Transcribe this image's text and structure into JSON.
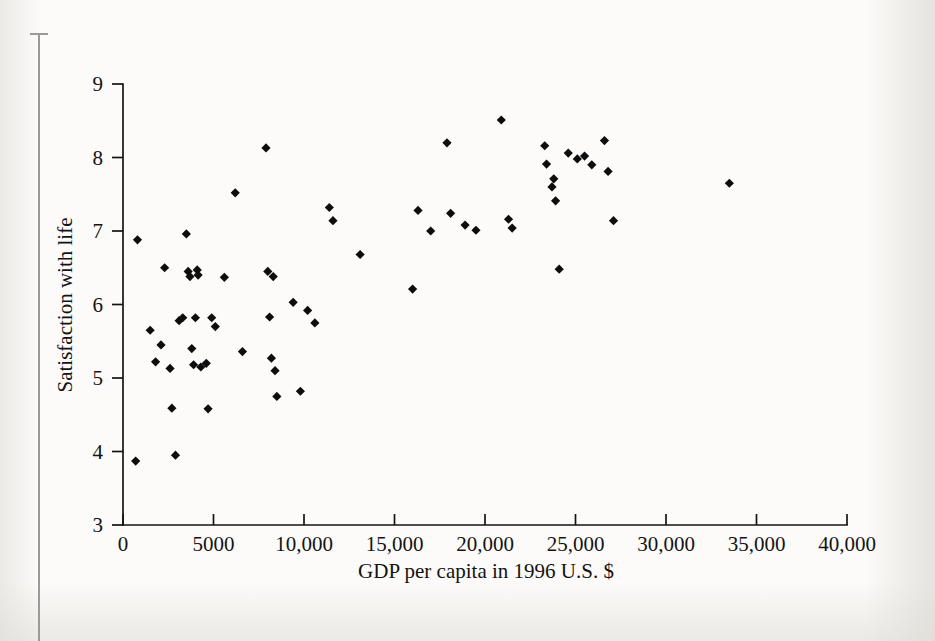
{
  "figure": {
    "background_color": "#fcfbf9",
    "marker_color": "#0d0d0d",
    "axis_color": "#141414",
    "gutter_rule_color": "#9a9a98"
  },
  "chart_data": {
    "type": "scatter",
    "title": "",
    "xlabel": "GDP per capita in 1996 U.S. $",
    "ylabel": "Satisfaction with life",
    "xlim": [
      0,
      40000
    ],
    "ylim": [
      3,
      9
    ],
    "grid": false,
    "legend": "none",
    "xticks": [
      0,
      5000,
      10000,
      15000,
      20000,
      25000,
      30000,
      35000,
      40000
    ],
    "xticklabels": [
      "0",
      "5000",
      "10,000",
      "15,000",
      "20,000",
      "25,000",
      "30,000",
      "35,000",
      "40,000"
    ],
    "yticks": [
      3,
      4,
      5,
      6,
      7,
      8,
      9
    ],
    "yticklabels": [
      "3",
      "4",
      "5",
      "6",
      "7",
      "8",
      "9"
    ],
    "marker": "diamond",
    "n_points": 66,
    "points": [
      {
        "x": 800,
        "y": 6.88
      },
      {
        "x": 700,
        "y": 3.87
      },
      {
        "x": 1500,
        "y": 5.65
      },
      {
        "x": 1800,
        "y": 5.22
      },
      {
        "x": 2100,
        "y": 5.45
      },
      {
        "x": 2300,
        "y": 6.5
      },
      {
        "x": 2600,
        "y": 5.13
      },
      {
        "x": 2700,
        "y": 4.59
      },
      {
        "x": 2900,
        "y": 3.95
      },
      {
        "x": 3100,
        "y": 5.78
      },
      {
        "x": 3300,
        "y": 5.82
      },
      {
        "x": 3500,
        "y": 6.96
      },
      {
        "x": 3600,
        "y": 6.45
      },
      {
        "x": 3700,
        "y": 6.38
      },
      {
        "x": 3800,
        "y": 5.4
      },
      {
        "x": 3900,
        "y": 5.18
      },
      {
        "x": 4000,
        "y": 5.82
      },
      {
        "x": 4100,
        "y": 6.47
      },
      {
        "x": 4150,
        "y": 6.4
      },
      {
        "x": 4300,
        "y": 5.15
      },
      {
        "x": 4600,
        "y": 5.2
      },
      {
        "x": 4700,
        "y": 4.58
      },
      {
        "x": 4900,
        "y": 5.82
      },
      {
        "x": 5100,
        "y": 5.7
      },
      {
        "x": 5600,
        "y": 6.37
      },
      {
        "x": 6200,
        "y": 7.52
      },
      {
        "x": 6600,
        "y": 5.36
      },
      {
        "x": 7900,
        "y": 8.13
      },
      {
        "x": 8000,
        "y": 6.45
      },
      {
        "x": 8100,
        "y": 5.83
      },
      {
        "x": 8200,
        "y": 5.27
      },
      {
        "x": 8300,
        "y": 6.38
      },
      {
        "x": 8400,
        "y": 5.1
      },
      {
        "x": 8500,
        "y": 4.75
      },
      {
        "x": 9400,
        "y": 6.03
      },
      {
        "x": 9800,
        "y": 4.82
      },
      {
        "x": 10200,
        "y": 5.92
      },
      {
        "x": 10600,
        "y": 5.75
      },
      {
        "x": 11400,
        "y": 7.32
      },
      {
        "x": 11600,
        "y": 7.14
      },
      {
        "x": 13100,
        "y": 6.68
      },
      {
        "x": 16000,
        "y": 6.21
      },
      {
        "x": 16300,
        "y": 7.28
      },
      {
        "x": 17000,
        "y": 7.0
      },
      {
        "x": 17900,
        "y": 8.2
      },
      {
        "x": 18100,
        "y": 7.24
      },
      {
        "x": 18900,
        "y": 7.08
      },
      {
        "x": 19500,
        "y": 7.01
      },
      {
        "x": 20900,
        "y": 8.51
      },
      {
        "x": 21300,
        "y": 7.16
      },
      {
        "x": 21500,
        "y": 7.04
      },
      {
        "x": 23300,
        "y": 8.16
      },
      {
        "x": 23400,
        "y": 7.91
      },
      {
        "x": 23700,
        "y": 7.6
      },
      {
        "x": 23800,
        "y": 7.71
      },
      {
        "x": 23900,
        "y": 7.41
      },
      {
        "x": 24100,
        "y": 6.48
      },
      {
        "x": 24600,
        "y": 8.06
      },
      {
        "x": 25100,
        "y": 7.98
      },
      {
        "x": 25500,
        "y": 8.02
      },
      {
        "x": 25900,
        "y": 7.9
      },
      {
        "x": 26600,
        "y": 8.23
      },
      {
        "x": 26800,
        "y": 7.81
      },
      {
        "x": 27100,
        "y": 7.14
      },
      {
        "x": 33500,
        "y": 7.65
      }
    ]
  }
}
